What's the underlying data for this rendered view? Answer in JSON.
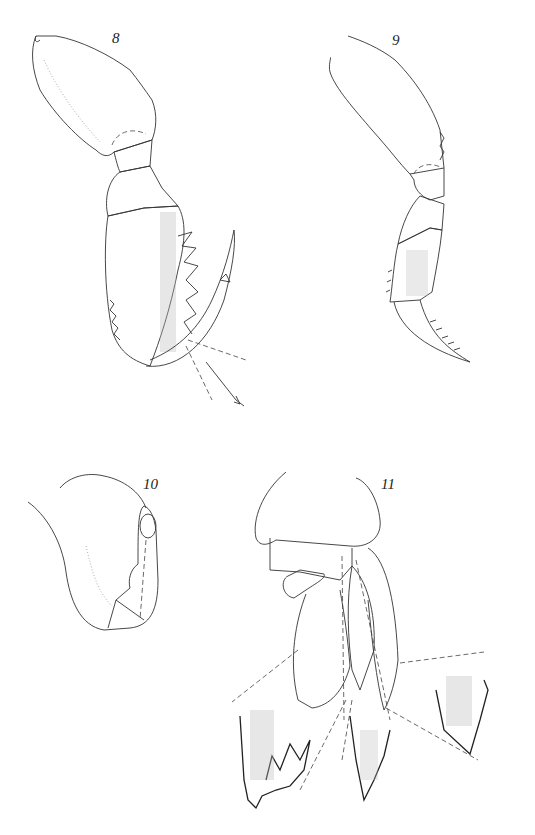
{
  "plate": {
    "figures": [
      {
        "id": "fig-8",
        "label": "8",
        "description": "leg appendage with subchelate propodus and curved dactylus, spines along palm"
      },
      {
        "id": "fig-9",
        "label": "9",
        "description": "slender leg appendage with setose carpus and spinulose dactylus"
      },
      {
        "id": "fig-10",
        "label": "10",
        "description": "rounded lobe / basal appendage with small articles"
      },
      {
        "id": "fig-11",
        "label": "11",
        "description": "biramous appendage with enlarged detail insets of serrate tips"
      }
    ]
  },
  "colors": {
    "background": "#ffffff",
    "line": "#333333",
    "stipple": "#bbbbbb"
  }
}
